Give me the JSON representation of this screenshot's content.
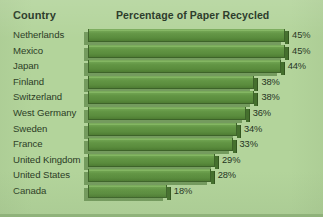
{
  "header": {
    "country_column_label": "Country",
    "title": "Percentage of Paper Recycled"
  },
  "colors": {
    "background": "#b3d49b",
    "bar_fill": "#629544",
    "bar_edge": "#3d6329",
    "bar_shadow": "#3f6b2c",
    "text": "#2a3a24",
    "header_text": "#20301c"
  },
  "chart_data": {
    "type": "bar",
    "orientation": "horizontal",
    "title": "Percentage of Paper Recycled",
    "xlabel": "",
    "ylabel": "Country",
    "xlim": [
      0,
      50
    ],
    "grid": false,
    "legend": null,
    "value_suffix": "%",
    "categories": [
      "Netherlands",
      "Mexico",
      "Japan",
      "Finland",
      "Switzerland",
      "West Germany",
      "Sweden",
      "France",
      "United Kingdom",
      "United States",
      "Canada"
    ],
    "values": [
      45,
      45,
      44,
      38,
      38,
      36,
      34,
      33,
      29,
      28,
      18
    ],
    "labels": [
      "45%",
      "45%",
      "44%",
      "38%",
      "38%",
      "36%",
      "34%",
      "33%",
      "29%",
      "28%",
      "18%"
    ]
  }
}
